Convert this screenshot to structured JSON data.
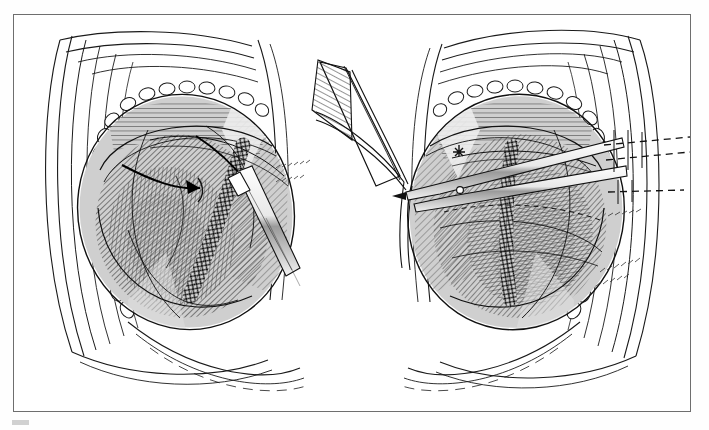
{
  "document": {
    "type": "surgical-illustration",
    "style": "pen-and-ink line engraving, grayscale",
    "title": "Two-panel operative illustration of abdominal wall wound closure",
    "frame_color": "#6e6e6e",
    "background_color": "#ffffff",
    "ink_color": "#1a1a1a",
    "caption": ""
  },
  "panels": [
    {
      "id": "panel-left",
      "label": "",
      "description": "Left operative field: retracted abdominal wound showing layered skin edge, subcutaneous fat, hatched muscle, and a braided running suture line with two directional arrows and a needle holder/forceps.",
      "elements": [
        {
          "name": "skin-edge-layers",
          "note": "concentric outline lines of skin and fascia"
        },
        {
          "name": "subcutaneous-fat-globules",
          "note": "chain of rounded fat lobules along the wound margin"
        },
        {
          "name": "muscle-hatching",
          "note": "dense parallel hatch shading of muscle belly"
        },
        {
          "name": "braided-suture-line",
          "note": "diagonal cross-hatched running suture band"
        },
        {
          "name": "arrow-left",
          "note": "black arrow pointing right into wound base"
        },
        {
          "name": "arrow-right",
          "note": "black arrow pointing down-right toward suture"
        },
        {
          "name": "forceps-instrument",
          "note": "long tapered instrument entering from lower right"
        },
        {
          "name": "retractor-thread",
          "note": "fine curved traction threads across the field"
        }
      ]
    },
    {
      "id": "panel-right",
      "label": "",
      "description": "Right operative field: same wound with a scissors/hemostat instrument in place, a retracted hatched tissue flap at upper left, braided suture, and dashed suture marker lines extending to the right margin.",
      "elements": [
        {
          "name": "skin-edge-layers",
          "note": "concentric outline lines of skin and fascia"
        },
        {
          "name": "subcutaneous-fat-globules",
          "note": "chain of rounded fat lobules along the wound margin"
        },
        {
          "name": "muscle-hatching",
          "note": "dense parallel hatch shading of muscle belly"
        },
        {
          "name": "braided-suture-line",
          "note": "vertical cross-hatched running suture band"
        },
        {
          "name": "scissors-instrument",
          "note": "long scissors with visible hinge pivot"
        },
        {
          "name": "retractor-blade",
          "note": "flat hatched retractor blade at upper left of panel"
        },
        {
          "name": "dashed-suture-markers",
          "note": "three horizontal dashed lines at right margin"
        },
        {
          "name": "star-marker",
          "note": "small asterisk/star mark on tissue at left of panel"
        }
      ]
    }
  ],
  "palette": {
    "ink": "#1a1a1a",
    "mid_gray": "#8c8c8c",
    "light_gray": "#c7c7c7",
    "tissue_tint": "#b9b9b9",
    "paper": "#ffffff",
    "frame": "#6e6e6e"
  }
}
